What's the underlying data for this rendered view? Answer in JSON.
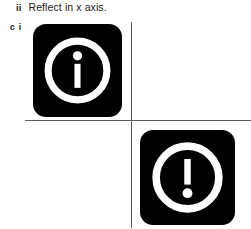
{
  "page": {
    "background_color": "#ffffff",
    "width": 251,
    "height": 229
  },
  "question": {
    "part_marker": "ii",
    "text": "Reflect in x axis."
  },
  "answer_label": {
    "letter": "c",
    "roman": "i"
  },
  "axes": {
    "line_color": "#5e5e5e",
    "origin_x": 131,
    "origin_y": 120,
    "x_axis_label": "",
    "y_axis_label": ""
  },
  "shapes": [
    {
      "name": "info-icon",
      "icon": "information-circle-icon",
      "glyph": "i",
      "quadrant": "top-left",
      "orientation": "original",
      "fill_color": "#000000",
      "mark_color": "#ffffff"
    },
    {
      "name": "exclamation-icon",
      "icon": "exclamation-circle-icon",
      "glyph": "!",
      "quadrant": "bottom-right",
      "orientation": "reflected-in-x-axis",
      "fill_color": "#000000",
      "mark_color": "#ffffff"
    }
  ]
}
